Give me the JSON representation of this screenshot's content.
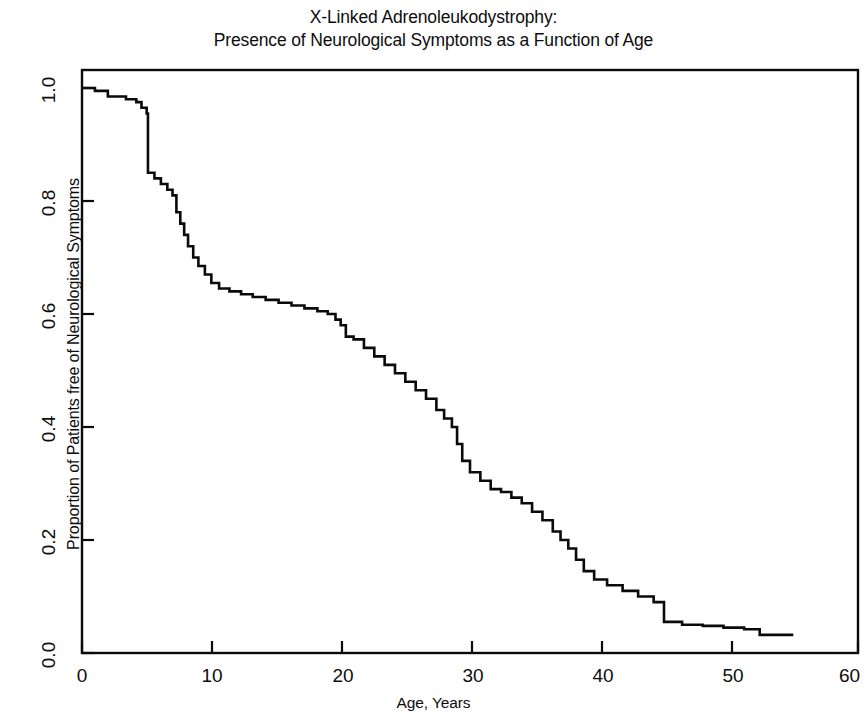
{
  "figure": {
    "title_line1": "X-Linked Adrenoleukodystrophy:",
    "title_line2": "Presence of Neurological Symptoms as a Function of Age",
    "background_color": "#ffffff",
    "line_color": "#0a0a0a"
  },
  "axes": {
    "x_title": "Age, Years",
    "y_title": "Proportion of Patients free of Neurological Symptoms",
    "x_ticks": [
      "0",
      "10",
      "20",
      "30",
      "40",
      "50",
      "60"
    ],
    "y_ticks": [
      "0.0",
      "0.2",
      "0.4",
      "0.6",
      "0.8",
      "1.0"
    ]
  },
  "chart_data": {
    "type": "line",
    "title": "X-Linked Adrenoleukodystrophy: Presence of Neurological Symptoms as a Function of Age",
    "subtitle": "Kaplan-Meier step curve",
    "xlabel": "Age, Years",
    "ylabel": "Proportion of Patients free of Neurological Symptoms",
    "xlim": [
      0,
      60
    ],
    "ylim": [
      0.0,
      1.0
    ],
    "xticks": [
      0,
      10,
      20,
      30,
      40,
      50,
      60
    ],
    "yticks": [
      0.0,
      0.2,
      0.4,
      0.6,
      0.8,
      1.0
    ],
    "grid": false,
    "legend": false,
    "step_style": "post",
    "series": [
      {
        "name": "Proportion free of neurological symptoms",
        "x": [
          0.0,
          1.0,
          2.0,
          3.4,
          4.2,
          4.6,
          5.0,
          5.1,
          5.6,
          6.1,
          6.6,
          7.0,
          7.3,
          7.6,
          7.9,
          8.2,
          8.6,
          9.0,
          9.5,
          10.0,
          10.6,
          11.4,
          12.3,
          13.2,
          14.2,
          15.2,
          16.2,
          17.2,
          18.2,
          19.0,
          19.6,
          20.0,
          20.4,
          21.0,
          21.8,
          22.6,
          23.4,
          24.2,
          25.0,
          25.8,
          26.6,
          27.4,
          28.0,
          28.6,
          29.0,
          29.4,
          30.0,
          30.8,
          31.6,
          32.4,
          33.2,
          34.0,
          34.8,
          35.6,
          36.4,
          37.0,
          37.6,
          38.2,
          38.8,
          39.6,
          40.6,
          41.8,
          43.0,
          44.2,
          45.0,
          46.4,
          48.0,
          49.6,
          51.2,
          52.4,
          55.0
        ],
        "y": [
          1.0,
          0.995,
          0.985,
          0.98,
          0.975,
          0.965,
          0.955,
          0.85,
          0.84,
          0.83,
          0.82,
          0.81,
          0.78,
          0.76,
          0.74,
          0.72,
          0.7,
          0.685,
          0.67,
          0.655,
          0.645,
          0.64,
          0.635,
          0.63,
          0.625,
          0.62,
          0.615,
          0.61,
          0.605,
          0.6,
          0.59,
          0.58,
          0.56,
          0.555,
          0.54,
          0.525,
          0.51,
          0.495,
          0.48,
          0.465,
          0.45,
          0.43,
          0.415,
          0.4,
          0.37,
          0.34,
          0.32,
          0.305,
          0.29,
          0.285,
          0.275,
          0.265,
          0.25,
          0.235,
          0.215,
          0.2,
          0.185,
          0.165,
          0.145,
          0.13,
          0.12,
          0.11,
          0.1,
          0.09,
          0.055,
          0.05,
          0.048,
          0.045,
          0.042,
          0.032,
          0.032
        ]
      }
    ]
  }
}
